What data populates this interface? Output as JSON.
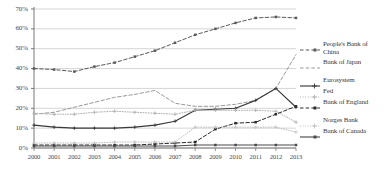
{
  "chart_data": {
    "type": "line",
    "title": "",
    "xlabel": "",
    "ylabel": "",
    "x": [
      2000,
      2001,
      2002,
      2003,
      2004,
      2005,
      2006,
      2007,
      2008,
      2009,
      2010,
      2011,
      2012,
      2013
    ],
    "xtick_labels": [
      "2000",
      "2001",
      "2002",
      "2003",
      "2004",
      "2005",
      "2006",
      "2007",
      "2008",
      "2009",
      "2010",
      "2011",
      "2012",
      "2013"
    ],
    "ytick_labels": [
      "0%",
      "10%",
      "20%",
      "30%",
      "40%",
      "50%",
      "60%",
      "70%"
    ],
    "ytick_values": [
      0,
      10,
      20,
      30,
      40,
      50,
      60,
      70
    ],
    "ylim": [
      0,
      70
    ],
    "grid": "horizontal",
    "legend_position": "right",
    "series": [
      {
        "name": "People's Bank of China",
        "color": "#5a5a5a",
        "style": "dashed",
        "marker": "square",
        "values": [
          40,
          39.5,
          38.5,
          41,
          43,
          46,
          49,
          53,
          57,
          60,
          63,
          65.5,
          66,
          65.5
        ]
      },
      {
        "name": "Bank of Japan",
        "color": "#9a9a9a",
        "style": "dashed",
        "marker": "none",
        "values": [
          17,
          18,
          20.5,
          23,
          25.5,
          27,
          29,
          22.5,
          21,
          21,
          22,
          24,
          30,
          47
        ]
      },
      {
        "name": "Eurosystem",
        "color": "#3a3a3a",
        "style": "solid",
        "marker": "plus",
        "values": [
          11.5,
          10.5,
          10,
          10,
          10,
          10.5,
          11.5,
          13.5,
          19,
          19.5,
          20,
          24,
          30,
          20.5
        ]
      },
      {
        "name": "Fed",
        "color": "#b0b0b0",
        "style": "dotted",
        "marker": "plus",
        "values": [
          17.5,
          17,
          17,
          18,
          18.5,
          18,
          17.5,
          17,
          19,
          19,
          19,
          19,
          18.5,
          13
        ]
      },
      {
        "name": "Bank of England",
        "color": "#2a2a2a",
        "style": "dashed",
        "marker": "square",
        "values": [
          1.5,
          1.5,
          1.5,
          1.5,
          1.5,
          1.5,
          2,
          2.5,
          3,
          9.5,
          12.5,
          13,
          17,
          21
        ]
      },
      {
        "name": "Norges Bank",
        "color": "#c0c0c0",
        "style": "dotted",
        "marker": "plus",
        "values": [
          2.5,
          2.5,
          2.5,
          2.5,
          3,
          3,
          3,
          3,
          10.5,
          10.5,
          10.5,
          10.5,
          10.5,
          8
        ]
      },
      {
        "name": "Bank of Canada",
        "color": "#4a4a4a",
        "style": "solid",
        "marker": "square",
        "values": [
          1,
          1,
          1,
          1,
          1,
          1,
          1,
          1,
          1.5,
          1.5,
          1.5,
          1.5,
          1.5,
          1.5
        ]
      }
    ]
  },
  "legend": {
    "entries": [
      {
        "label": "People's Bank of China"
      },
      {
        "label": "Bank of Japan"
      },
      {
        "label": "Eurosystem"
      },
      {
        "label": "Fed"
      },
      {
        "label": "Bank of England"
      },
      {
        "label": "Norges Bank"
      },
      {
        "label": "Bank of Canada"
      }
    ]
  }
}
